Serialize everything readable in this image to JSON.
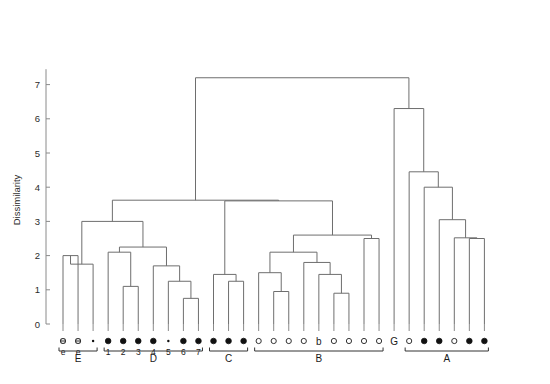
{
  "figure": {
    "type": "dendrogram",
    "ylabel": "Dissimilarity",
    "background_color": "#ffffff",
    "line_color": "#6e6e6e",
    "axis_color": "#8a8a8a",
    "text_color": "#1a1a1a"
  },
  "yaxis": {
    "ticks": [
      "0",
      "1",
      "2",
      "3",
      "4",
      "5",
      "6",
      "7"
    ],
    "min": 0,
    "max": 7.45,
    "label": "Dissimilarity"
  },
  "chart_data": {
    "type": "dendrogram",
    "title": "",
    "xlabel": "",
    "ylabel": "Dissimilarity",
    "ylim": [
      0,
      7.45
    ],
    "grid": false,
    "legend": "none",
    "n_leaves": 29,
    "leaves": [
      {
        "i": 0,
        "label": "e",
        "marker": "open-small",
        "group": "E"
      },
      {
        "i": 1,
        "label": "e",
        "marker": "open-small",
        "group": "E"
      },
      {
        "i": 2,
        "label": "",
        "marker": "dot-tiny",
        "group": "E"
      },
      {
        "i": 3,
        "label": "1",
        "marker": "filled",
        "group": "D"
      },
      {
        "i": 4,
        "label": "2",
        "marker": "filled",
        "group": "D"
      },
      {
        "i": 5,
        "label": "3",
        "marker": "filled",
        "group": "D"
      },
      {
        "i": 6,
        "label": "4",
        "marker": "filled",
        "group": "D"
      },
      {
        "i": 7,
        "label": "5",
        "marker": "dot-tiny",
        "group": "D"
      },
      {
        "i": 8,
        "label": "6",
        "marker": "filled",
        "group": "D"
      },
      {
        "i": 9,
        "label": "7",
        "marker": "filled",
        "group": "D"
      },
      {
        "i": 10,
        "label": "",
        "marker": "filled",
        "group": "C"
      },
      {
        "i": 11,
        "label": "",
        "marker": "filled",
        "group": "C"
      },
      {
        "i": 12,
        "label": "",
        "marker": "filled",
        "group": "C"
      },
      {
        "i": 13,
        "label": "",
        "marker": "open",
        "group": "B"
      },
      {
        "i": 14,
        "label": "",
        "marker": "open",
        "group": "B"
      },
      {
        "i": 15,
        "label": "",
        "marker": "open",
        "group": "B"
      },
      {
        "i": 16,
        "label": "",
        "marker": "open",
        "group": "B"
      },
      {
        "i": 17,
        "label": "b",
        "marker": "text",
        "group": "B"
      },
      {
        "i": 18,
        "label": "",
        "marker": "open",
        "group": "B"
      },
      {
        "i": 19,
        "label": "",
        "marker": "open",
        "group": "B"
      },
      {
        "i": 20,
        "label": "",
        "marker": "open",
        "group": "B"
      },
      {
        "i": 21,
        "label": "",
        "marker": "open",
        "group": "B"
      },
      {
        "i": 22,
        "label": "G",
        "marker": "text",
        "group": "G"
      },
      {
        "i": 23,
        "label": "",
        "marker": "open",
        "group": "A"
      },
      {
        "i": 24,
        "label": "",
        "marker": "filled",
        "group": "A"
      },
      {
        "i": 25,
        "label": "",
        "marker": "filled",
        "group": "A"
      },
      {
        "i": 26,
        "label": "",
        "marker": "open",
        "group": "A"
      },
      {
        "i": 27,
        "label": "",
        "marker": "filled",
        "group": "A"
      },
      {
        "i": 28,
        "label": "",
        "marker": "filled",
        "group": "A"
      }
    ],
    "merges": [
      {
        "id": "m_E_01",
        "left": 0,
        "right": 1,
        "height": 2.0,
        "note": "e + e"
      },
      {
        "id": "m_E_all",
        "left": "m_E_01",
        "right": 2,
        "height": 1.75,
        "note": "E cluster",
        "alt_left": 0
      },
      {
        "id": "m_D_23",
        "left": 4,
        "right": 5,
        "height": 1.1
      },
      {
        "id": "m_D_123",
        "left": 3,
        "right": "m_D_23",
        "height": 2.1
      },
      {
        "id": "m_D_67",
        "left": 8,
        "right": 9,
        "height": 0.75
      },
      {
        "id": "m_D_567",
        "left": 7,
        "right": "m_D_67",
        "height": 1.25
      },
      {
        "id": "m_D_4567",
        "left": 6,
        "right": "m_D_567",
        "height": 1.7
      },
      {
        "id": "m_D_all",
        "left": "m_D_123",
        "right": "m_D_4567",
        "height": 2.25
      },
      {
        "id": "m_ED",
        "left": "m_E_all",
        "right": "m_D_all",
        "height": 3.0
      },
      {
        "id": "m_C_23",
        "left": 11,
        "right": 12,
        "height": 1.25
      },
      {
        "id": "m_C_all",
        "left": 10,
        "right": "m_C_23",
        "height": 1.45
      },
      {
        "id": "m_B_23",
        "left": 14,
        "right": 15,
        "height": 0.95
      },
      {
        "id": "m_B_123",
        "left": 13,
        "right": "m_B_23",
        "height": 1.5
      },
      {
        "id": "m_B_67",
        "left": 18,
        "right": 19,
        "height": 0.9
      },
      {
        "id": "m_B_567",
        "left": 17,
        "right": "m_B_67",
        "height": 1.45
      },
      {
        "id": "m_B_4567",
        "left": 16,
        "right": "m_B_567",
        "height": 1.8
      },
      {
        "id": "m_B_left",
        "left": "m_B_123",
        "right": "m_B_4567",
        "height": 2.1
      },
      {
        "id": "m_B_89",
        "left": 20,
        "right": 21,
        "height": 2.5
      },
      {
        "id": "m_B_all",
        "left": "m_B_left",
        "right": "m_B_89",
        "height": 2.6
      },
      {
        "id": "m_CB",
        "left": "m_C_all",
        "right": "m_B_all",
        "height": 3.6
      },
      {
        "id": "m_EDCB",
        "left": "m_ED",
        "right": "m_CB",
        "height": 3.62
      },
      {
        "id": "m_A_56",
        "left": 27,
        "right": 28,
        "height": 2.5
      },
      {
        "id": "m_A_456",
        "left": 26,
        "right": "m_A_56",
        "height": 2.52
      },
      {
        "id": "m_A_3456",
        "left": 25,
        "right": "m_A_456",
        "height": 3.05
      },
      {
        "id": "m_A_2345",
        "left": 24,
        "right": "m_A_3456",
        "height": 4.0
      },
      {
        "id": "m_A_all",
        "left": 23,
        "right": "m_A_2345",
        "height": 4.45
      },
      {
        "id": "m_GA",
        "left": 22,
        "right": "m_A_all",
        "height": 6.3
      },
      {
        "id": "m_root",
        "left": "m_EDCB",
        "right": "m_GA",
        "height": 7.2
      }
    ],
    "groups": [
      {
        "name": "E",
        "first_leaf": 0,
        "last_leaf": 2
      },
      {
        "name": "D",
        "first_leaf": 3,
        "last_leaf": 9
      },
      {
        "name": "C",
        "first_leaf": 10,
        "last_leaf": 12
      },
      {
        "name": "B",
        "first_leaf": 13,
        "last_leaf": 21
      },
      {
        "name": "A",
        "first_leaf": 23,
        "last_leaf": 28
      }
    ],
    "annotations": [
      {
        "text": "b",
        "at_leaf": 17,
        "kind": "leaf-label"
      },
      {
        "text": "G",
        "at_leaf": 22,
        "kind": "leaf-label"
      }
    ]
  }
}
